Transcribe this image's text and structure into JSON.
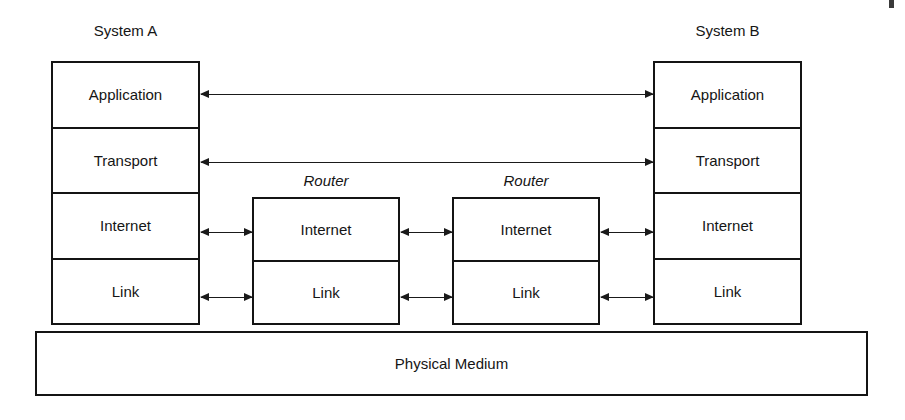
{
  "diagram": {
    "systems": [
      {
        "caption": "System A",
        "layers": [
          "Application",
          "Transport",
          "Internet",
          "Link"
        ]
      },
      {
        "caption": "System B",
        "layers": [
          "Application",
          "Transport",
          "Internet",
          "Link"
        ]
      }
    ],
    "routers": [
      {
        "caption": "Router",
        "layers": [
          "Internet",
          "Link"
        ]
      },
      {
        "caption": "Router",
        "layers": [
          "Internet",
          "Link"
        ]
      }
    ],
    "physical_medium": {
      "label": "Physical Medium"
    },
    "connections": [
      {
        "name": "application-peer-link",
        "layer": "Application",
        "from": "System A",
        "to": "System B",
        "direction": "bidirectional"
      },
      {
        "name": "transport-peer-link",
        "layer": "Transport",
        "from": "System A",
        "to": "System B",
        "direction": "bidirectional"
      },
      {
        "name": "internet-hop-a-r1",
        "layer": "Internet",
        "from": "System A",
        "to": "Router 1",
        "direction": "bidirectional"
      },
      {
        "name": "internet-hop-r1-r2",
        "layer": "Internet",
        "from": "Router 1",
        "to": "Router 2",
        "direction": "bidirectional"
      },
      {
        "name": "internet-hop-r2-b",
        "layer": "Internet",
        "from": "Router 2",
        "to": "System B",
        "direction": "bidirectional"
      },
      {
        "name": "link-hop-a-r1",
        "layer": "Link",
        "from": "System A",
        "to": "Router 1",
        "direction": "bidirectional"
      },
      {
        "name": "link-hop-r1-r2",
        "layer": "Link",
        "from": "Router 1",
        "to": "Router 2",
        "direction": "bidirectional"
      },
      {
        "name": "link-hop-r2-b",
        "layer": "Link",
        "from": "Router 2",
        "to": "System B",
        "direction": "bidirectional"
      }
    ],
    "colors": {
      "stroke": "#141414",
      "background": "#ffffff",
      "text": "#151515"
    }
  }
}
